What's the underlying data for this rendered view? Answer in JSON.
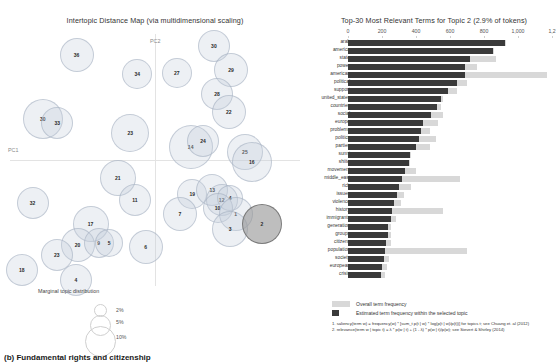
{
  "left": {
    "title": "Intertopic Distance Map (via multidimensional scaling)",
    "axis": {
      "pc1": "PC1",
      "pc2": "PC2"
    },
    "size_legend": {
      "title": "Marginal topic distribution",
      "steps": [
        "2%",
        "5%",
        "10%"
      ]
    },
    "topics": [
      {
        "id": "36",
        "x": 0.247,
        "y": 0.1,
        "r": 17,
        "selected": false
      },
      {
        "id": "34",
        "x": 0.443,
        "y": 0.175,
        "r": 15,
        "selected": false
      },
      {
        "id": "27",
        "x": 0.57,
        "y": 0.17,
        "r": 15,
        "selected": false
      },
      {
        "id": "30",
        "x": 0.69,
        "y": 0.068,
        "r": 16,
        "selected": false
      },
      {
        "id": "29",
        "x": 0.745,
        "y": 0.16,
        "r": 17,
        "selected": false
      },
      {
        "id": "28",
        "x": 0.7,
        "y": 0.25,
        "r": 16,
        "selected": false
      },
      {
        "id": "22",
        "x": 0.738,
        "y": 0.318,
        "r": 17,
        "selected": false
      },
      {
        "id": "30b",
        "label": "30",
        "x": 0.138,
        "y": 0.345,
        "r": 20,
        "selected": false
      },
      {
        "id": "33",
        "x": 0.185,
        "y": 0.36,
        "r": 16,
        "selected": false
      },
      {
        "id": "23b",
        "label": "23",
        "x": 0.42,
        "y": 0.395,
        "r": 19,
        "selected": false
      },
      {
        "id": "14",
        "x": 0.615,
        "y": 0.45,
        "r": 22,
        "selected": false
      },
      {
        "id": "24",
        "x": 0.655,
        "y": 0.428,
        "r": 16,
        "selected": false
      },
      {
        "id": "25",
        "x": 0.79,
        "y": 0.468,
        "r": 18,
        "selected": false
      },
      {
        "id": "16",
        "x": 0.812,
        "y": 0.505,
        "r": 20,
        "selected": false
      },
      {
        "id": "21",
        "x": 0.38,
        "y": 0.565,
        "r": 18,
        "selected": false
      },
      {
        "id": "32",
        "x": 0.105,
        "y": 0.66,
        "r": 16,
        "selected": false
      },
      {
        "id": "11",
        "x": 0.435,
        "y": 0.648,
        "r": 16,
        "selected": false
      },
      {
        "id": "19",
        "x": 0.62,
        "y": 0.628,
        "r": 15,
        "selected": false
      },
      {
        "id": "13",
        "x": 0.685,
        "y": 0.612,
        "r": 16,
        "selected": false
      },
      {
        "id": "12",
        "x": 0.715,
        "y": 0.648,
        "r": 16,
        "selected": false
      },
      {
        "id": "4b",
        "label": "4",
        "x": 0.742,
        "y": 0.64,
        "r": 13,
        "selected": false
      },
      {
        "id": "10",
        "x": 0.702,
        "y": 0.678,
        "r": 15,
        "selected": false
      },
      {
        "id": "1",
        "x": 0.76,
        "y": 0.7,
        "r": 17,
        "selected": false
      },
      {
        "id": "7",
        "x": 0.58,
        "y": 0.7,
        "r": 17,
        "selected": false
      },
      {
        "id": "3",
        "x": 0.742,
        "y": 0.76,
        "r": 18,
        "selected": false
      },
      {
        "id": "2",
        "x": 0.845,
        "y": 0.74,
        "r": 20,
        "selected": true
      },
      {
        "id": "17",
        "x": 0.292,
        "y": 0.74,
        "r": 18,
        "selected": false
      },
      {
        "id": "20",
        "x": 0.25,
        "y": 0.818,
        "r": 17,
        "selected": false
      },
      {
        "id": "9",
        "x": 0.318,
        "y": 0.812,
        "r": 15,
        "selected": false
      },
      {
        "id": "5",
        "x": 0.352,
        "y": 0.81,
        "r": 14,
        "selected": false
      },
      {
        "id": "6",
        "x": 0.47,
        "y": 0.828,
        "r": 17,
        "selected": false
      },
      {
        "id": "23",
        "x": 0.183,
        "y": 0.858,
        "r": 16,
        "selected": false
      },
      {
        "id": "18",
        "x": 0.07,
        "y": 0.915,
        "r": 16,
        "selected": false
      },
      {
        "id": "4",
        "x": 0.245,
        "y": 0.95,
        "r": 16,
        "selected": false
      }
    ]
  },
  "right": {
    "title": "Top-30 Most Relevant Terms for Topic 2 (2.9% of tokens)",
    "legend": {
      "overall": "Overall term frequency",
      "topic": "Estimated term frequency within the selected topic"
    },
    "footnotes": [
      "1. saliency(term w) = frequency(w) * [sum_t p(t | w) * log(p(t | w)/p(t))] for topics t; see Chuang et. al (2012)",
      "2. relevance(term w | topic t) = λ * p(w | t) + (1 - λ) * p(w | t)/p(w); see Sievert & Shirley (2014)"
    ]
  },
  "bottom_caption": "(b) Fundamental rights and citizenship",
  "chart_data": {
    "type": "bar",
    "title": "Top-30 Most Relevant Terms for Topic 2 (2.9% of tokens)",
    "xlabel": "",
    "ylabel": "",
    "orientation": "horizontal",
    "xlim": [
      0,
      1200
    ],
    "xticks": [
      0,
      200,
      400,
      600,
      800,
      1000,
      1200
    ],
    "xticklabels": [
      "0",
      "200",
      "400",
      "600",
      "800",
      "1,000",
      "1,2"
    ],
    "grid": false,
    "legend_position": "bottom-left",
    "categories": [
      "arab",
      "america",
      "state",
      "power",
      "american",
      "political",
      "support",
      "united_states",
      "countries",
      "social",
      "europe",
      "problems",
      "politics",
      "parties",
      "sunni",
      "shiite",
      "movement",
      "middle_east",
      "rich",
      "issues",
      "violence",
      "history",
      "immigrants",
      "generation",
      "groups",
      "citizens",
      "population",
      "society",
      "european",
      "crisis"
    ],
    "series": [
      {
        "name": "Overall term frequency",
        "values": [
          930,
          860,
          870,
          760,
          1170,
          700,
          640,
          560,
          545,
          560,
          530,
          480,
          520,
          480,
          370,
          365,
          400,
          660,
          370,
          330,
          310,
          560,
          280,
          250,
          250,
          250,
          700,
          240,
          230,
          215
        ]
      },
      {
        "name": "Estimated term frequency within the selected topic",
        "values": [
          925,
          855,
          720,
          690,
          690,
          640,
          590,
          545,
          525,
          490,
          440,
          430,
          420,
          400,
          365,
          360,
          335,
          320,
          300,
          290,
          270,
          260,
          250,
          235,
          235,
          225,
          215,
          210,
          200,
          195
        ]
      }
    ]
  }
}
